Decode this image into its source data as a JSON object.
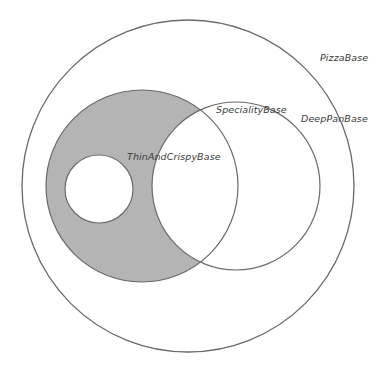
{
  "diagram": {
    "type": "venn",
    "colors": {
      "stroke": "#6a6a6a",
      "shaded_fill": "#b4b4b4",
      "background": "#ffffff",
      "label": "#3a3a3a"
    },
    "sets": [
      {
        "name": "PizzaBase",
        "label": "PizzaBase",
        "shape": {
          "cx": 188,
          "cy": 186,
          "r": 166
        }
      },
      {
        "name": "ThinAndCrispyBase",
        "label": "ThinAndCrispyBase",
        "shaded": true,
        "shape": {
          "cx": 142,
          "cy": 186,
          "r": 96
        }
      },
      {
        "name": "DeepPanBase",
        "label": "DeepPanBase",
        "shape": {
          "cx": 236,
          "cy": 186,
          "r": 84
        }
      },
      {
        "name": "SpecialityBase",
        "label": "SpecialityBase",
        "shape": {
          "cx": 99,
          "cy": 189,
          "r": 34
        }
      }
    ],
    "labels": {
      "pizza_base": "PizzaBase",
      "speciality_base": "SpecialityBase",
      "deep_pan_base": "DeepPanBase",
      "thin_and_crispy_base": "ThinAndCrispyBase"
    }
  }
}
